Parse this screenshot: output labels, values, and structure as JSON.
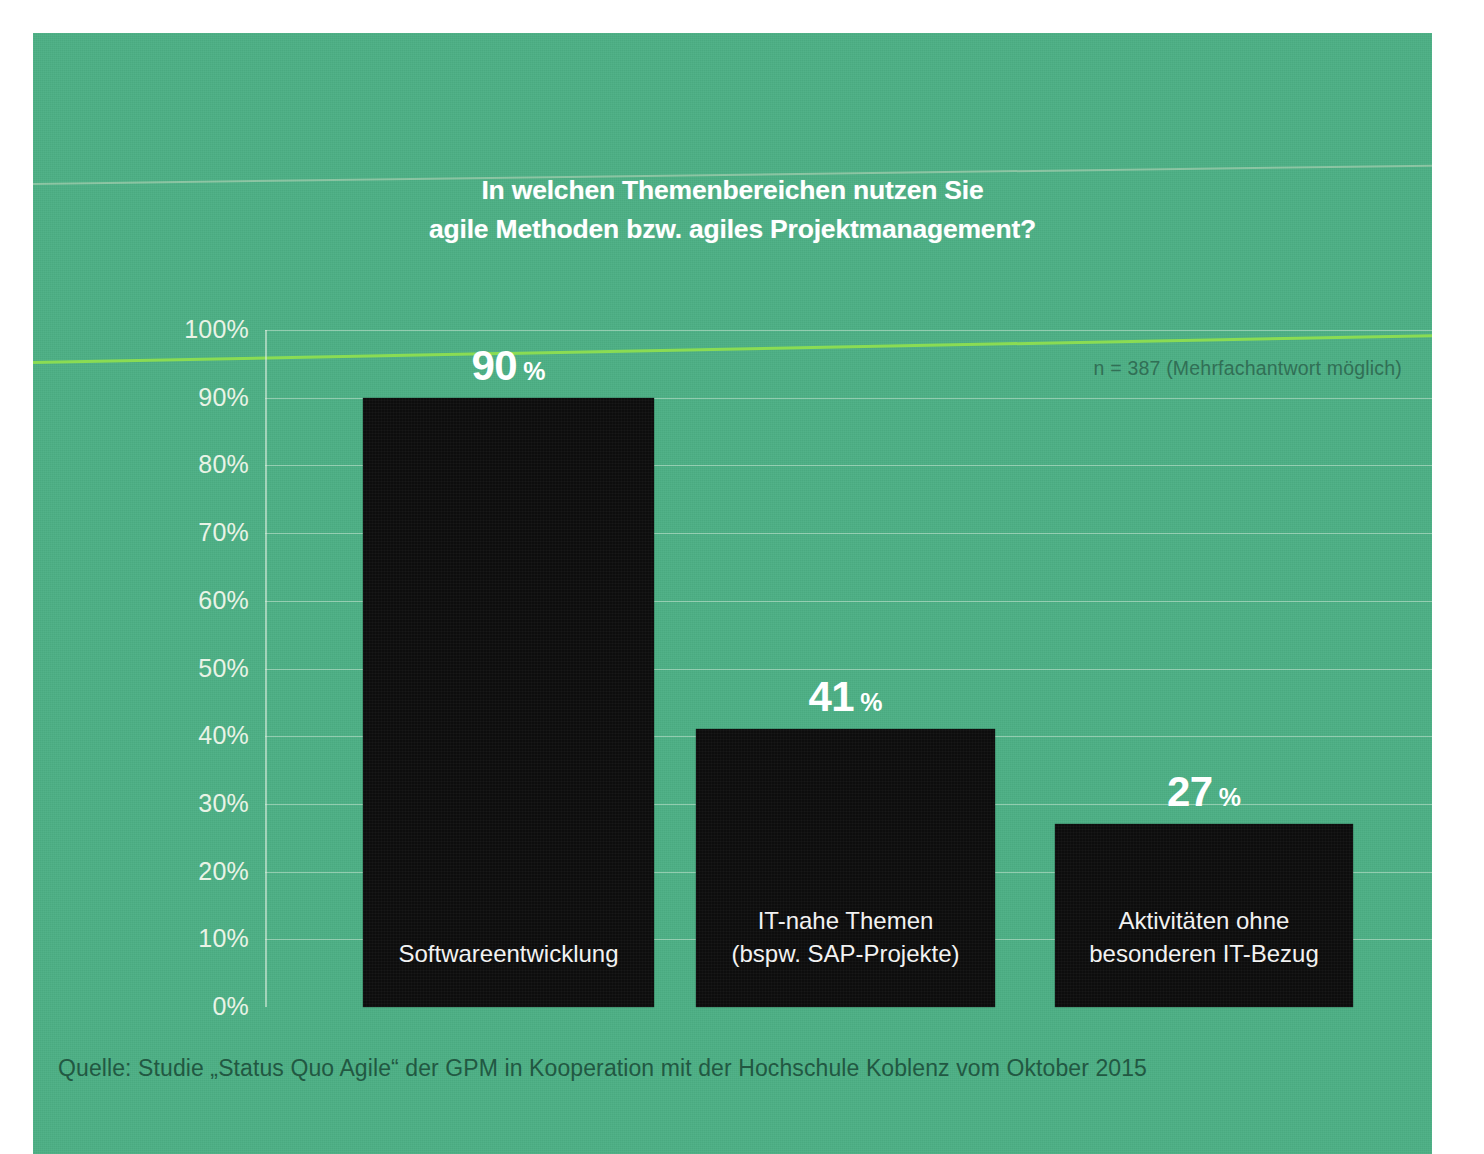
{
  "figure": {
    "title_line1": "In welchen Themenbereichen nutzen Sie",
    "title_line2": "agile Methoden bzw. agiles Projektmanagement?",
    "sample_note": "n = 387 (Mehrfachantwort möglich)",
    "source_note": "Quelle: Studie „Status Quo Agile“ der GPM in Kooperation mit der Hochschule Koblenz vom Oktober 2015",
    "background_color": "#4cb085",
    "bar_color": "#0d0d0d",
    "text_color": "#ffffff",
    "gridline_color": "#e9f3e6",
    "source_text_color": "#20543f"
  },
  "chart_data": {
    "type": "bar",
    "title": "In welchen Themenbereichen nutzen Sie agile Methoden bzw. agiles Projektmanagement?",
    "xlabel": "",
    "ylabel": "",
    "ylim": [
      0,
      100
    ],
    "grid": true,
    "legend": "none",
    "unit": "%",
    "annotation": "n = 387 (Mehrfachantwort möglich)",
    "source": "Quelle: Studie „Status Quo Agile“ der GPM in Kooperation mit der Hochschule Koblenz vom Oktober 2015",
    "categories": [
      "Softwareentwicklung",
      "IT-nahe Themen (bspw. SAP-Projekte)",
      "Aktivitäten ohne besonderen IT-Bezug"
    ],
    "values": [
      90,
      41,
      27
    ],
    "bars": [
      {
        "label_line1": "Softwareentwicklung",
        "label_line2": "",
        "value": 90,
        "value_text": "90",
        "unit_text": "%"
      },
      {
        "label_line1": "IT-nahe Themen",
        "label_line2": "(bspw. SAP-Projekte)",
        "value": 41,
        "value_text": "41",
        "unit_text": "%"
      },
      {
        "label_line1": "Aktivitäten ohne",
        "label_line2": "besonderen IT-Bezug",
        "value": 27,
        "value_text": "27",
        "unit_text": "%"
      }
    ],
    "y_ticks": [
      {
        "value": 100,
        "label": "100%"
      },
      {
        "value": 90,
        "label": "90%"
      },
      {
        "value": 80,
        "label": "80%"
      },
      {
        "value": 70,
        "label": "70%"
      },
      {
        "value": 60,
        "label": "60%"
      },
      {
        "value": 50,
        "label": "50%"
      },
      {
        "value": 40,
        "label": "40%"
      },
      {
        "value": 30,
        "label": "30%"
      },
      {
        "value": 20,
        "label": "20%"
      },
      {
        "value": 10,
        "label": "10%"
      },
      {
        "value": 0,
        "label": "0%"
      }
    ]
  }
}
